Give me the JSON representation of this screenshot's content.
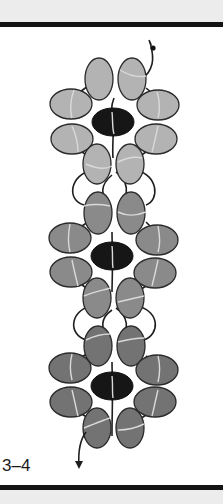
{
  "figure": {
    "label": "3–4"
  },
  "colors": {
    "band": "#ececec",
    "rule": "#141414",
    "flower_1_petal": "#b3b3b3",
    "flower_2_petal": "#8a8a8a",
    "flower_3_petal": "#737373",
    "center_bead": "#161616",
    "thread": "#1e1e1e",
    "thread_through_bead": "#d9d9d9"
  },
  "flowers": [
    {
      "name": "flower-top",
      "center": [
        113,
        122
      ],
      "tone": "light"
    },
    {
      "name": "flower-middle",
      "center": [
        112,
        256
      ],
      "tone": "medium"
    },
    {
      "name": "flower-bottom",
      "center": [
        112,
        386
      ],
      "tone": "dark"
    }
  ]
}
